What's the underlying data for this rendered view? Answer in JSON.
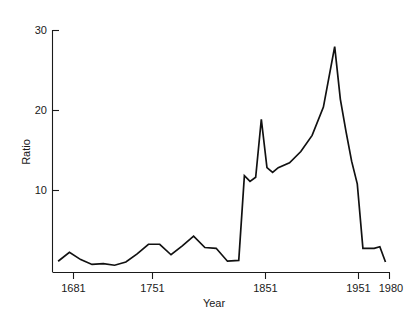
{
  "chart_data": {
    "type": "line",
    "title": "",
    "subtitle": "",
    "xlabel": "Year",
    "ylabel": "Ratio",
    "xlim": [
      1681,
      1980
    ],
    "ylim": [
      0,
      30
    ],
    "xticks": [
      1681,
      1751,
      1851,
      1951,
      1980
    ],
    "xticklabels": [
      "1681",
      "1751",
      "1851",
      "1951",
      "1980"
    ],
    "yticks": [
      10,
      20,
      30
    ],
    "yticklabels": [
      "10",
      "20",
      "30"
    ],
    "grid": false,
    "legend": null,
    "legend_position": "none",
    "line_color": "#111111",
    "series": [
      {
        "name": "Ratio",
        "x": [
          1686,
          1696,
          1706,
          1716,
          1726,
          1736,
          1746,
          1756,
          1766,
          1776,
          1786,
          1796,
          1806,
          1816,
          1826,
          1836,
          1846,
          1851,
          1856,
          1861,
          1866,
          1871,
          1876,
          1881,
          1891,
          1901,
          1911,
          1921,
          1931,
          1936,
          1941,
          1946,
          1951,
          1956,
          1966,
          1971,
          1976
        ],
        "values": [
          1.4,
          2.5,
          1.6,
          1.0,
          1.1,
          0.9,
          1.3,
          2.3,
          3.5,
          3.5,
          2.2,
          3.3,
          4.5,
          3.1,
          3.0,
          1.4,
          1.5,
          12.0,
          11.3,
          11.8,
          19.0,
          13.0,
          12.4,
          13.0,
          13.6,
          15.0,
          17.0,
          20.5,
          28.0,
          21.5,
          17.5,
          13.8,
          11.0,
          3.0,
          3.0,
          3.2,
          1.3
        ]
      }
    ]
  },
  "axis": {
    "y_label": "Ratio",
    "x_label": "Year"
  }
}
